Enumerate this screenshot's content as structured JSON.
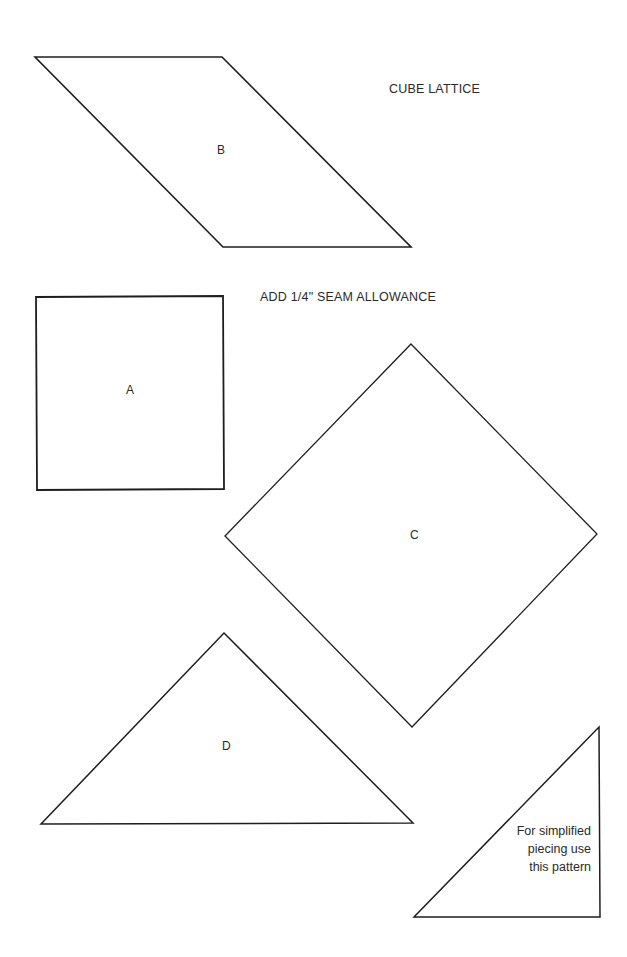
{
  "title": "CUBE LATTICE",
  "instruction": "ADD 1/4\" SEAM ALLOWANCE",
  "pieces": [
    {
      "id": "B",
      "label": "B",
      "shape": "parallelogram",
      "points": [
        [
          35,
          57
        ],
        [
          222,
          57
        ],
        [
          411,
          247
        ],
        [
          223,
          247
        ]
      ]
    },
    {
      "id": "A",
      "label": "A",
      "shape": "square",
      "points": [
        [
          36,
          297
        ],
        [
          223,
          296
        ],
        [
          224,
          489
        ],
        [
          37,
          490
        ]
      ]
    },
    {
      "id": "C",
      "label": "C",
      "shape": "diamond",
      "points": [
        [
          411,
          344
        ],
        [
          597,
          534
        ],
        [
          412,
          727
        ],
        [
          225,
          536
        ]
      ]
    },
    {
      "id": "D",
      "label": "D",
      "shape": "triangle",
      "points": [
        [
          224,
          633
        ],
        [
          413,
          823
        ],
        [
          41,
          824
        ]
      ]
    },
    {
      "id": "simplified",
      "label": "",
      "shape": "right-triangle",
      "points": [
        [
          599,
          727
        ],
        [
          600,
          917
        ],
        [
          414,
          917
        ]
      ]
    }
  ],
  "note": {
    "lines": [
      "For simplified",
      "piecing use",
      "this pattern"
    ]
  },
  "colors": {
    "stroke": "#1e1e1e",
    "text": "#2a2a2a",
    "background": "#ffffff"
  }
}
